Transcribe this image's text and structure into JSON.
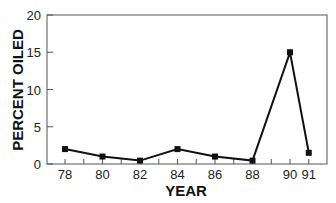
{
  "chart_data": {
    "type": "line",
    "title": "",
    "xlabel": "YEAR",
    "ylabel": "PERCENT OILED",
    "x": [
      78,
      80,
      82,
      84,
      86,
      88,
      90,
      91
    ],
    "series": [
      {
        "name": "Percent oiled",
        "values": [
          2.0,
          1.0,
          0.45,
          2.0,
          1.0,
          0.45,
          15.0,
          1.5
        ]
      }
    ],
    "x_tick_labels": [
      "78",
      "80",
      "82",
      "84",
      "86",
      "88",
      "90",
      "91"
    ],
    "y_tick_labels": [
      "0",
      "5",
      "10",
      "15",
      "20"
    ],
    "ylim": [
      0,
      20
    ],
    "xlim": [
      77,
      92
    ],
    "grid": false,
    "legend": "none",
    "marker": "square",
    "colors": {
      "line": "#111111",
      "axis": "#555555",
      "text": "#222222"
    }
  }
}
